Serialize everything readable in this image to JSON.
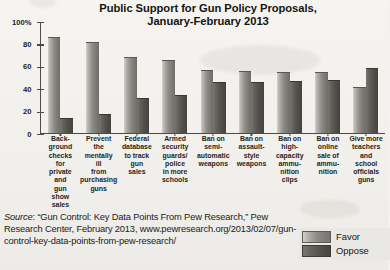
{
  "chart_data": {
    "type": "bar",
    "title": "Public Support for Gun Policy Proposals, January-February 2013",
    "title_lines": [
      "Public Support for Gun Policy Proposals,",
      "January-February 2013"
    ],
    "xlabel": "",
    "ylabel": "",
    "ylim": [
      0,
      100
    ],
    "grid": false,
    "legend_position": "bottom-right",
    "yticks": [
      "0",
      "20",
      "40",
      "60",
      "80",
      "100%"
    ],
    "ytick_values": [
      0,
      20,
      40,
      60,
      80,
      100
    ],
    "categories": [
      "Background checks for private and gun show sales",
      "Prevent the mentally ill from purchasing guns",
      "Federal database to track gun sales",
      "Armed security guards/police in more schools",
      "Ban on semi-automatic weapons",
      "Ban on assault-style weapons",
      "Ban on high-capacity ammunition clips",
      "Ban on online sale of ammunition",
      "Give more teachers and school officials guns"
    ],
    "category_lines": [
      [
        "Back-",
        "ground",
        "checks",
        "for",
        "private",
        "and",
        "gun",
        "show",
        "sales"
      ],
      [
        "Prevent",
        "the",
        "mentally",
        "ill",
        "from",
        "purchasing",
        "guns"
      ],
      [
        "Federal",
        "database",
        "to track",
        "gun",
        "sales"
      ],
      [
        "Armed",
        "security",
        "guards/",
        "police",
        "in more",
        "schools"
      ],
      [
        "Ban on",
        "semi-",
        "automatic",
        "weapons"
      ],
      [
        "Ban on",
        "assault-",
        "style",
        "weapons"
      ],
      [
        "Ban on",
        "high-",
        "capacity",
        "ammu-",
        "nition",
        "clips"
      ],
      [
        "Ban on",
        "online",
        "sale of",
        "ammu-",
        "nition"
      ],
      [
        "Give more",
        "teachers",
        "and",
        "school",
        "officials",
        "guns"
      ]
    ],
    "series": [
      {
        "name": "Favor",
        "color": "#8e8d87",
        "values": [
          85,
          80,
          67,
          64,
          55,
          54,
          53,
          53,
          40
        ]
      },
      {
        "name": "Oppose",
        "color": "#4e4d48",
        "values": [
          12,
          16,
          30,
          33,
          44,
          44,
          45,
          46,
          57
        ]
      }
    ]
  },
  "legend": {
    "items": [
      {
        "label": "Favor",
        "swatch": "favor"
      },
      {
        "label": "Oppose",
        "swatch": "oppose"
      }
    ]
  },
  "source": {
    "label": "Source",
    "text": ": “Gun Control: Key Data Points From Pew Research,” Pew Research Center, February 2013, www.pewresearch.org/2013/02/07/gun-control-key-data-points-from-pew-research/"
  }
}
